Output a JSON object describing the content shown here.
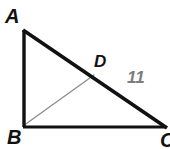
{
  "figure": {
    "type": "geometry-diagram",
    "background_color": "#ffffff",
    "width": 170,
    "height": 149,
    "labels": {
      "vertex_a": "A",
      "vertex_b": "B",
      "vertex_c": "C",
      "point_d": "D",
      "segment_length": "11"
    },
    "colors": {
      "triangle_stroke": "#111111",
      "cevian_stroke": "#8c8c8c",
      "label_text": "#111111",
      "measure_text": "#7d7d7d"
    },
    "geometry": {
      "points": {
        "A": [
          23,
          30
        ],
        "B": [
          23,
          127
        ],
        "C": [
          166,
          127
        ],
        "D": [
          93,
          76
        ]
      },
      "segments": [
        {
          "name": "AB",
          "from": "A",
          "to": "B",
          "style": "thick-black"
        },
        {
          "name": "BC",
          "from": "B",
          "to": "C",
          "style": "thick-black"
        },
        {
          "name": "AC",
          "from": "A",
          "to": "C",
          "style": "thick-black"
        },
        {
          "name": "BD",
          "from": "B",
          "to": "D",
          "style": "thin-gray"
        }
      ],
      "measure_on_segment": "DC"
    }
  }
}
